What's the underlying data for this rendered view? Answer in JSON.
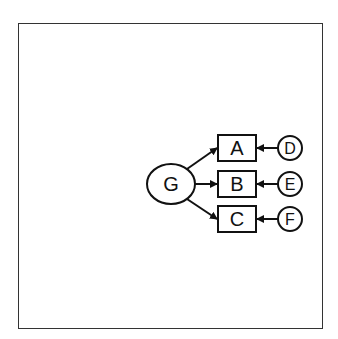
{
  "diagram": {
    "nodes": [
      {
        "id": "G",
        "label": "G",
        "shape": "ellipse"
      },
      {
        "id": "A",
        "label": "A",
        "shape": "box"
      },
      {
        "id": "B",
        "label": "B",
        "shape": "box"
      },
      {
        "id": "C",
        "label": "C",
        "shape": "box"
      },
      {
        "id": "D",
        "label": "D",
        "shape": "circle"
      },
      {
        "id": "E",
        "label": "E",
        "shape": "circle"
      },
      {
        "id": "F",
        "label": "F",
        "shape": "circle"
      }
    ],
    "edges": [
      {
        "from": "G",
        "to": "A"
      },
      {
        "from": "G",
        "to": "B"
      },
      {
        "from": "G",
        "to": "C"
      },
      {
        "from": "D",
        "to": "A"
      },
      {
        "from": "E",
        "to": "B"
      },
      {
        "from": "F",
        "to": "C"
      }
    ],
    "colors": {
      "stroke": "#111111",
      "background": "#ffffff",
      "frame": "#333333"
    }
  }
}
